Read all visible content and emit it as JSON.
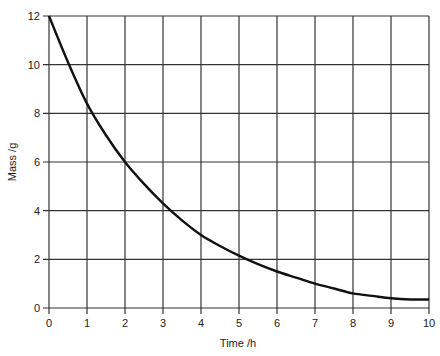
{
  "chart_data": {
    "type": "line",
    "title": "",
    "xlabel": "Time /h",
    "ylabel": "Mass /g",
    "xlim": [
      0,
      10
    ],
    "ylim": [
      0,
      12
    ],
    "grid": true,
    "x_ticks": [
      "0",
      "1",
      "2",
      "3",
      "4",
      "5",
      "6",
      "7",
      "8",
      "9",
      "10"
    ],
    "y_ticks": [
      "0",
      "2",
      "4",
      "6",
      "8",
      "10",
      "12"
    ],
    "series": [
      {
        "name": "Mass",
        "x": [
          0,
          0.5,
          1,
          1.5,
          2,
          2.5,
          3,
          3.5,
          4,
          4.5,
          5,
          5.5,
          6,
          6.5,
          7,
          7.5,
          8,
          8.5,
          9,
          9.5,
          10
        ],
        "values": [
          12,
          10.1,
          8.4,
          7.1,
          6.0,
          5.1,
          4.3,
          3.6,
          3.0,
          2.55,
          2.15,
          1.8,
          1.5,
          1.25,
          1.0,
          0.8,
          0.6,
          0.5,
          0.4,
          0.35,
          0.35
        ]
      }
    ]
  }
}
